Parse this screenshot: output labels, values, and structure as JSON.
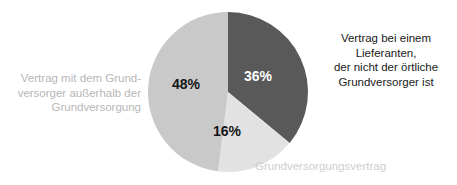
{
  "background_color": "#ffffff",
  "chart_data": {
    "type": "pie",
    "title": "",
    "subtitle": "",
    "xlabel": "",
    "ylabel": "",
    "grid": false,
    "legend_position": "around-slices",
    "units": "percent",
    "start_angle_deg": 0,
    "direction": "clockwise",
    "center_px": [
      228,
      92
    ],
    "radius_px": 80,
    "categories": [
      "Vertrag bei einem Lieferanten, der nicht der örtliche Grundversorger ist",
      "Grundversorgungsvertrag",
      "Vertrag mit dem Grundversorger außerhalb der Grundversorgung"
    ],
    "values": [
      36,
      16,
      48
    ],
    "value_labels": [
      "36%",
      "16%",
      "48%"
    ],
    "colors": [
      "#595959",
      "#e2e2e2",
      "#c9c9c9"
    ],
    "value_label_colors": [
      "#ffffff",
      "#161616",
      "#161616"
    ],
    "slices": [
      {
        "label": "Vertrag bei einem Lieferanten, der nicht der örtliche Grundversorger ist",
        "value": 36,
        "value_label": "36%",
        "color": "#595959",
        "start_deg": 0,
        "end_deg": 129.6
      },
      {
        "label": "Grundversorgungsvertrag",
        "value": 16,
        "value_label": "16%",
        "color": "#e2e2e2",
        "start_deg": 129.6,
        "end_deg": 187.2
      },
      {
        "label": "Vertrag mit dem Grundversorger außerhalb der Grundversorgung",
        "value": 48,
        "value_label": "48%",
        "color": "#c9c9c9",
        "start_deg": 187.2,
        "end_deg": 360
      }
    ]
  },
  "labels": {
    "right": "Vertrag bei einem Lieferanten,\nder nicht der örtliche\nGrundversorger ist",
    "left": "Vertrag mit dem Grund-\nversorger außerhalb der\nGrundversorgung",
    "bottom": "Grundversorgungsvertrag",
    "right_color": "#1a1a1a",
    "left_color": "#b7b7b7",
    "bottom_color": "#cecece"
  },
  "values": {
    "v36": "36%",
    "v16": "16%",
    "v48": "48%"
  }
}
